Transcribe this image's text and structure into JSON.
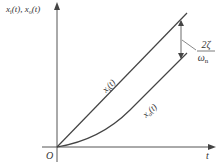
{
  "diagram": {
    "y_axis_label": "x",
    "y_axis_label_sub1": "i",
    "y_axis_label_mid": "(t), x",
    "y_axis_label_sub2": "o",
    "y_axis_label_end": "(t)",
    "x_axis_label": "t",
    "origin_label": "O",
    "input_curve_label": "x",
    "input_curve_sub": "i",
    "input_curve_end": "(t)",
    "output_curve_label": "x",
    "output_curve_sub": "o",
    "output_curve_end": "(t)",
    "steady_state_error_numerator": "2ζ",
    "steady_state_error_denominator": "ω",
    "steady_state_error_denominator_sub": "n"
  },
  "colors": {
    "line": "#444444",
    "text": "#333333",
    "background": "#ffffff"
  }
}
